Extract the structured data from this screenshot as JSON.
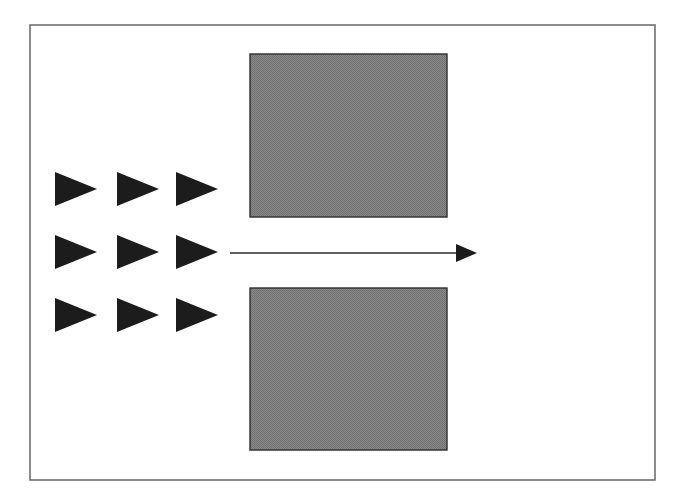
{
  "figure": {
    "title": "",
    "background_color": "#ffffff",
    "frame": {
      "name": "outer-frame",
      "x": 30,
      "y": 25,
      "width": 625,
      "height": 455,
      "stroke_color": "#6f6f6f",
      "stroke_width": 1.6,
      "fill": "none"
    },
    "triangle_grid": {
      "name": "triangle-grid",
      "rows": 3,
      "columns": 3,
      "count": 9,
      "orientation": "right-pointing",
      "fill_color": "#1c1c1c",
      "item_width": 42,
      "item_height": 34,
      "column_x": [
        55,
        117,
        176
      ],
      "row_y": [
        172,
        235,
        298
      ],
      "items": [
        {
          "label": "triangle-r1-c1",
          "x": 55,
          "y": 172
        },
        {
          "label": "triangle-r1-c2",
          "x": 117,
          "y": 172
        },
        {
          "label": "triangle-r1-c3",
          "x": 176,
          "y": 172
        },
        {
          "label": "triangle-r2-c1",
          "x": 55,
          "y": 235
        },
        {
          "label": "triangle-r2-c2",
          "x": 117,
          "y": 235
        },
        {
          "label": "triangle-r2-c3",
          "x": 176,
          "y": 235
        },
        {
          "label": "triangle-r3-c1",
          "x": 55,
          "y": 298
        },
        {
          "label": "triangle-r3-c2",
          "x": 117,
          "y": 298
        },
        {
          "label": "triangle-r3-c3",
          "x": 176,
          "y": 298
        }
      ]
    },
    "rectangles": [
      {
        "name": "gray-rectangle-top",
        "x": 250,
        "y": 54,
        "width": 197,
        "height": 163,
        "fill_color": "#808080",
        "stroke_color": "#2e2e2e",
        "stroke_width": 1.4
      },
      {
        "name": "gray-rectangle-bottom",
        "x": 250,
        "y": 288,
        "width": 197,
        "height": 162,
        "fill_color": "#808080",
        "stroke_color": "#2e2e2e",
        "stroke_width": 1.4
      }
    ],
    "arrow": {
      "name": "horizontal-arrow",
      "direction": "right",
      "x_start": 230,
      "x_end": 477,
      "y": 253,
      "line_color": "#2b2b2b",
      "line_width": 1.6,
      "head_length": 21,
      "head_half_height": 9,
      "head_fill": "#1c1c1c"
    }
  }
}
